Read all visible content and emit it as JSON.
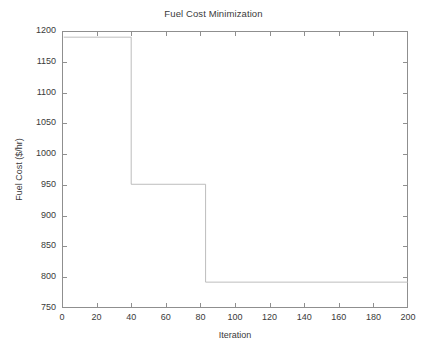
{
  "chart_data": {
    "type": "line",
    "title": "Fuel Cost Minimization",
    "xlabel": "Iteration",
    "ylabel": "Fuel Cost ($/hr)",
    "xlim": [
      0,
      200
    ],
    "ylim": [
      750,
      1200
    ],
    "xticks": [
      0,
      20,
      40,
      60,
      80,
      100,
      120,
      140,
      160,
      180,
      200
    ],
    "yticks": [
      750,
      800,
      850,
      900,
      950,
      1000,
      1050,
      1100,
      1150,
      1200
    ],
    "xtick_labels": [
      "0",
      "20",
      "40",
      "60",
      "80",
      "100",
      "120",
      "140",
      "160",
      "180",
      "200"
    ],
    "ytick_labels": [
      "750",
      "800",
      "850",
      "900",
      "950",
      "1000",
      "1050",
      "1100",
      "1150",
      "1200"
    ],
    "grid": false,
    "legend": null,
    "line_color": "#b5b5b5",
    "line_width": 0.9,
    "drawstyle": "steps-post",
    "series": [
      {
        "name": "Best fuel cost",
        "x": [
          1,
          40,
          40,
          83,
          83,
          200
        ],
        "values": [
          1190,
          1190,
          951,
          951,
          792,
          792
        ]
      }
    ],
    "annotations": [
      {
        "text": "initial plateau",
        "value": 1190,
        "x_range": [
          1,
          40
        ]
      },
      {
        "text": "first improvement",
        "value": 951,
        "x_range": [
          40,
          83
        ]
      },
      {
        "text": "converged value",
        "value": 792,
        "x_range": [
          83,
          200
        ]
      }
    ]
  },
  "figure": {
    "background": "#ffffff",
    "axis_color": "#8f8f8f",
    "text_color": "#3a3a3a"
  }
}
